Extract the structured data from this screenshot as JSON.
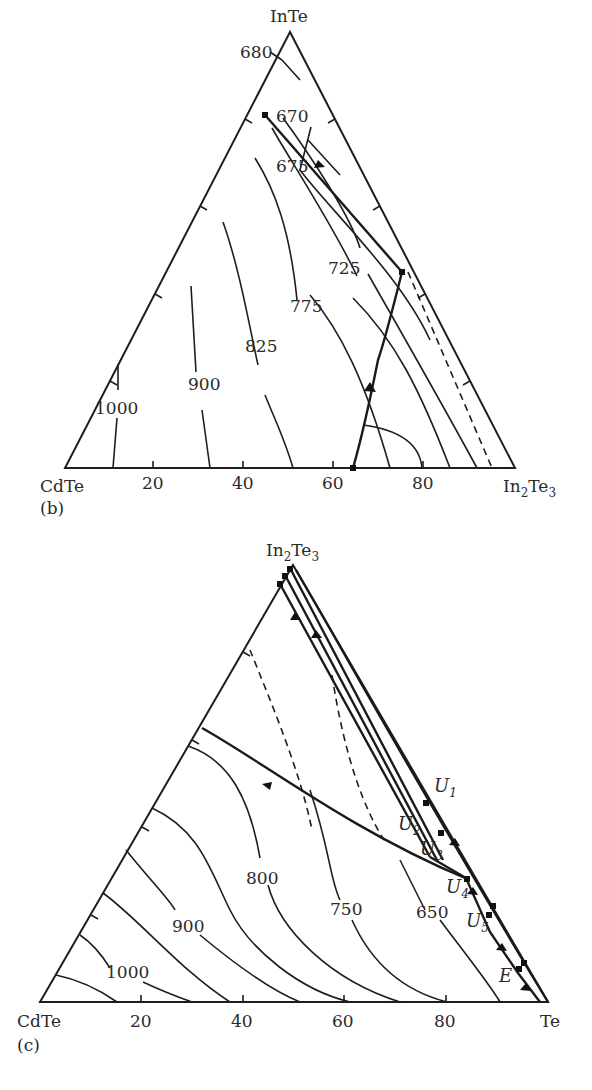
{
  "diagram_b": {
    "panel_label": "(b)",
    "vertices": {
      "top": "InTe",
      "left": "CdTe",
      "right_base": "In",
      "right_sub1": "2",
      "right_mid": "Te",
      "right_sub2": "3"
    },
    "axis_ticks": [
      "20",
      "40",
      "60",
      "80"
    ],
    "isotherm_labels": {
      "t680": "680",
      "t670": "670",
      "t675": "675",
      "t725": "725",
      "t775": "775",
      "t825": "825",
      "t900": "900",
      "t1000": "1000"
    }
  },
  "diagram_c": {
    "panel_label": "(c)",
    "vertices": {
      "top_base": "In",
      "top_sub1": "2",
      "top_mid": "Te",
      "top_sub2": "3",
      "left": "CdTe",
      "right": "Te"
    },
    "axis_ticks": [
      "20",
      "40",
      "60",
      "80"
    ],
    "isotherm_labels": {
      "t800": "800",
      "t900": "900",
      "t1000": "1000",
      "t750": "750",
      "t650": "650"
    },
    "invariant_points": {
      "U1": {
        "base": "U",
        "sub": "1"
      },
      "U2": {
        "base": "U",
        "sub": "2"
      },
      "U3": {
        "base": "U",
        "sub": "3"
      },
      "U4": {
        "base": "U",
        "sub": "4"
      },
      "U5": {
        "base": "U",
        "sub": "5"
      },
      "E": {
        "base": "E"
      }
    }
  },
  "colors": {
    "line": "#1e1e1e",
    "text": "#2a2a2a",
    "background": "#ffffff"
  }
}
